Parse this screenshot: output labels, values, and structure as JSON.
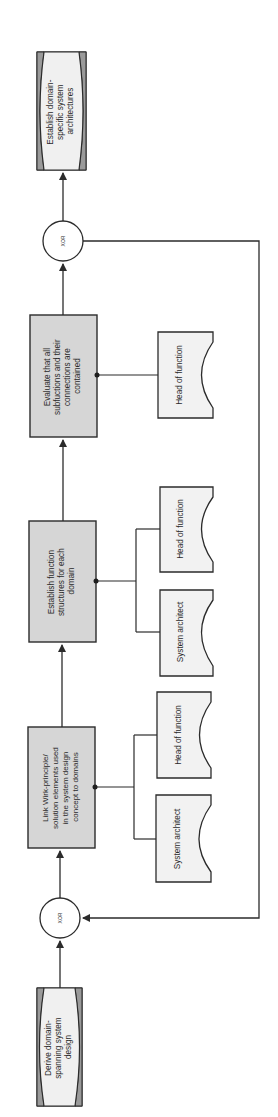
{
  "diagram": {
    "type": "EPC process chain (rotated 90°)",
    "orientation": "bottom-to-top",
    "colors": {
      "line": "#2b2b2b",
      "function_fill": "#d6d6d6",
      "event_fill": "#f0f0f0",
      "role_fill": "#f2f2f2",
      "background": "#ffffff"
    },
    "events": [
      {
        "id": "end_event",
        "lines": [
          "Establish domain-",
          "specific system",
          "architectures"
        ]
      },
      {
        "id": "start_event",
        "lines": [
          "Derive domain-",
          "spanning system",
          "design"
        ]
      }
    ],
    "connectors": [
      {
        "id": "xor_top",
        "label": "XOR"
      },
      {
        "id": "xor_bottom",
        "label": "XOR"
      }
    ],
    "functions": [
      {
        "id": "f_evaluate",
        "lines": [
          "Evaluate that all",
          "subfuctions and their",
          "connections are",
          "contained"
        ]
      },
      {
        "id": "f_establish",
        "lines": [
          "Establish function",
          "structures for each",
          "domain"
        ]
      },
      {
        "id": "f_link",
        "lines": [
          "Link Wirk-principle/",
          "solution elements used",
          "in the system design",
          "concept to domains"
        ]
      }
    ],
    "roles": [
      {
        "id": "r_eval_head",
        "label": "Head of function"
      },
      {
        "id": "r_est_head",
        "label": "Head of function"
      },
      {
        "id": "r_est_arch",
        "label": "System architect"
      },
      {
        "id": "r_link_head",
        "label": "Head of function"
      },
      {
        "id": "r_link_arch",
        "label": "System architect"
      }
    ]
  }
}
